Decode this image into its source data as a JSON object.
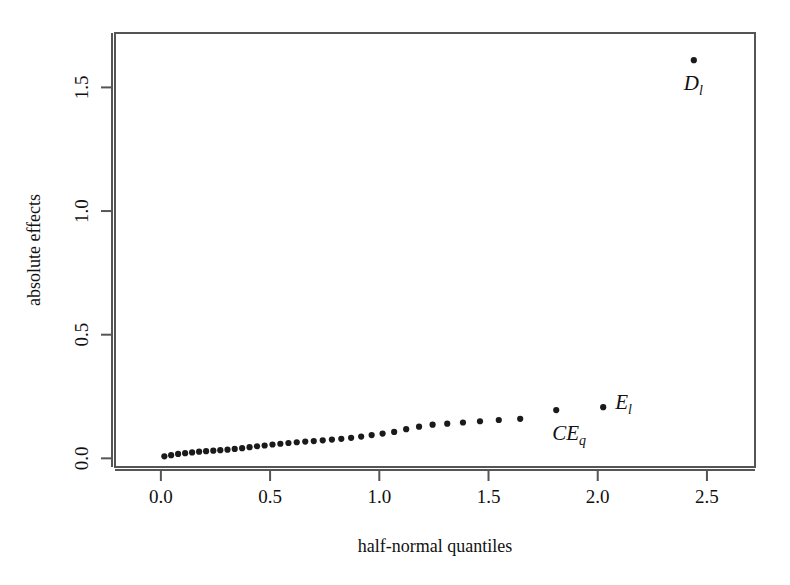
{
  "figure": {
    "background_color": "#ffffff",
    "point_color": "#1a1a1a",
    "frame_color": "#555555"
  },
  "chart_data": {
    "type": "scatter",
    "title": "",
    "xlabel": "half-normal quantiles",
    "ylabel": "absolute effects",
    "xlim": [
      -0.21,
      2.72
    ],
    "ylim": [
      -0.035,
      1.72
    ],
    "xticks": [
      0.0,
      0.5,
      1.0,
      1.5,
      2.0,
      2.5
    ],
    "xticklabels": [
      "0.0",
      "0.5",
      "1.0",
      "1.5",
      "2.0",
      "2.5"
    ],
    "yticks": [
      0.0,
      0.5,
      1.0,
      1.5
    ],
    "yticklabels": [
      "0.0",
      "0.5",
      "1.0",
      "1.5"
    ],
    "grid": false,
    "legend": null,
    "x": [
      0.016,
      0.047,
      0.079,
      0.111,
      0.143,
      0.175,
      0.207,
      0.24,
      0.272,
      0.305,
      0.338,
      0.372,
      0.406,
      0.44,
      0.475,
      0.511,
      0.547,
      0.584,
      0.622,
      0.661,
      0.7,
      0.741,
      0.783,
      0.826,
      0.871,
      0.917,
      0.965,
      1.015,
      1.068,
      1.123,
      1.182,
      1.244,
      1.311,
      1.383,
      1.461,
      1.547,
      1.645,
      1.81,
      2.025,
      2.44
    ],
    "y": [
      0.008,
      0.013,
      0.018,
      0.021,
      0.024,
      0.027,
      0.029,
      0.031,
      0.033,
      0.035,
      0.038,
      0.041,
      0.045,
      0.049,
      0.052,
      0.056,
      0.059,
      0.062,
      0.065,
      0.068,
      0.07,
      0.073,
      0.076,
      0.079,
      0.083,
      0.088,
      0.094,
      0.1,
      0.107,
      0.118,
      0.128,
      0.136,
      0.14,
      0.145,
      0.15,
      0.155,
      0.16,
      0.195,
      0.207,
      1.61
    ],
    "annotations": [
      {
        "name": "D-sub-l",
        "base": "D",
        "sub": "l",
        "x": 2.44,
        "y": 1.61,
        "label_dx": -10,
        "label_dy": 30
      },
      {
        "name": "E-sub-l",
        "base": "E",
        "sub": "l",
        "x": 2.025,
        "y": 0.207,
        "label_dx": 12,
        "label_dy": 2
      },
      {
        "name": "CE-sub-q",
        "base": "CE",
        "sub": "q",
        "x": 1.81,
        "y": 0.195,
        "label_dx": -4,
        "label_dy": 30
      }
    ]
  }
}
